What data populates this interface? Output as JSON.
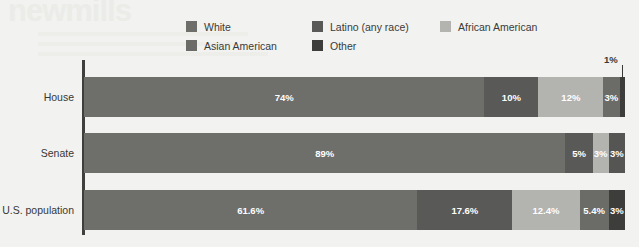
{
  "watermark": {
    "title": "newmills"
  },
  "legend": {
    "rows": [
      [
        {
          "label": "White",
          "color": "#6e6e6b"
        },
        {
          "label": "Latino (any race)",
          "color": "#595957"
        },
        {
          "label": "African American",
          "color": "#b3b3b0"
        }
      ],
      [
        {
          "label": "Asian American",
          "color": "#6b6b68"
        },
        {
          "label": "Other",
          "color": "#3d3d3b"
        }
      ]
    ]
  },
  "chart_data": {
    "type": "bar",
    "orientation": "horizontal",
    "stacked": true,
    "stacked_percent": true,
    "title": "",
    "subtitle": "",
    "xlabel": "",
    "ylabel": "",
    "xlim": [
      0,
      100
    ],
    "grid": false,
    "legend_position": "top",
    "categories": [
      "House",
      "Senate",
      "U.S. population"
    ],
    "series": [
      {
        "name": "White",
        "color": "#6e6e6b",
        "values": [
          74,
          89,
          61.6
        ]
      },
      {
        "name": "Latino (any race)",
        "color": "#595957",
        "values": [
          10,
          5,
          17.6
        ]
      },
      {
        "name": "African American",
        "color": "#b3b3b0",
        "values": [
          12,
          3,
          12.4
        ]
      },
      {
        "name": "Asian American",
        "color": "#6b6b68",
        "values": [
          3,
          3,
          5.4
        ]
      },
      {
        "name": "Other",
        "color": "#3d3d3b",
        "values": [
          1,
          0,
          3
        ]
      }
    ],
    "bars": [
      {
        "category": "House",
        "segments": [
          {
            "name": "White",
            "value": 74,
            "label": "74%",
            "color": "#6e6e6b",
            "show_label": true
          },
          {
            "name": "Latino (any race)",
            "value": 10,
            "label": "10%",
            "color": "#595957",
            "show_label": true
          },
          {
            "name": "African American",
            "value": 12,
            "label": "12%",
            "color": "#b3b3b0",
            "show_label": true
          },
          {
            "name": "Asian American",
            "value": 3,
            "label": "3%",
            "color": "#6b6b68",
            "show_label": true
          },
          {
            "name": "Other",
            "value": 1,
            "label": "1%",
            "color": "#3d3d3b",
            "show_label": false
          }
        ]
      },
      {
        "category": "Senate",
        "segments": [
          {
            "name": "White",
            "value": 89,
            "label": "89%",
            "color": "#6e6e6b",
            "show_label": true
          },
          {
            "name": "Latino (any race)",
            "value": 5,
            "label": "5%",
            "color": "#595957",
            "show_label": true
          },
          {
            "name": "African American",
            "value": 3,
            "label": "3%",
            "color": "#b3b3b0",
            "show_label": true
          },
          {
            "name": "Asian American",
            "value": 3,
            "label": "3%",
            "color": "#555553",
            "show_label": true
          }
        ]
      },
      {
        "category": "U.S. population",
        "segments": [
          {
            "name": "White",
            "value": 61.6,
            "label": "61.6%",
            "color": "#6e6e6b",
            "show_label": true
          },
          {
            "name": "Latino (any race)",
            "value": 17.6,
            "label": "17.6%",
            "color": "#595957",
            "show_label": true
          },
          {
            "name": "African American",
            "value": 12.4,
            "label": "12.4%",
            "color": "#b3b3b0",
            "show_label": true
          },
          {
            "name": "Asian American",
            "value": 5.4,
            "label": "5.4%",
            "color": "#6b6b68",
            "show_label": true
          },
          {
            "name": "Other",
            "value": 3,
            "label": "3%",
            "color": "#3d3d3b",
            "show_label": true
          }
        ]
      }
    ],
    "annotations": [
      {
        "text": "1%",
        "target_category": "House",
        "target_segment": "Other"
      }
    ]
  }
}
